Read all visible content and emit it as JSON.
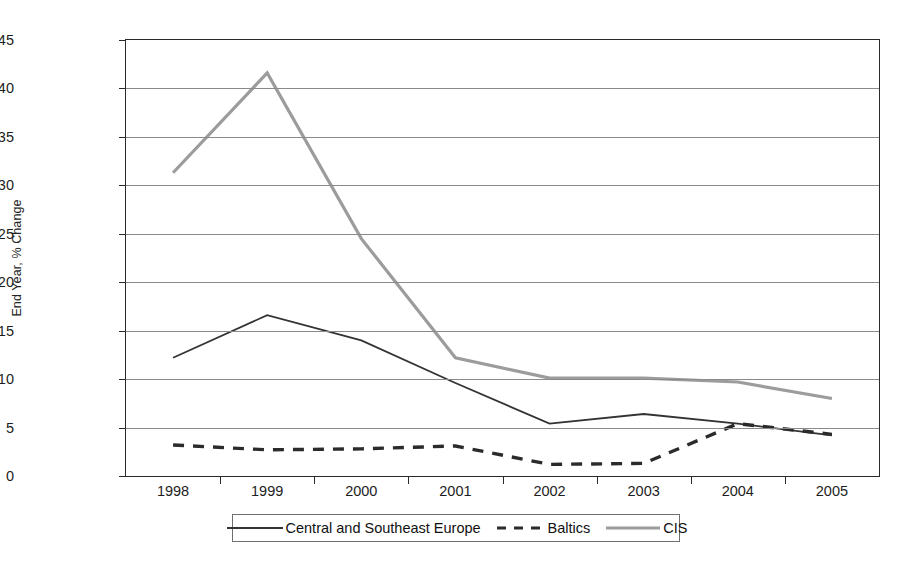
{
  "chart_data": {
    "type": "line",
    "title": "",
    "xlabel": "",
    "ylabel": "End Year, % Change",
    "categories": [
      "1998",
      "1999",
      "2000",
      "2001",
      "2002",
      "2003",
      "2004",
      "2005"
    ],
    "x": [
      1998,
      1999,
      2000,
      2001,
      2002,
      2003,
      2004,
      2005
    ],
    "ylim": [
      0,
      45
    ],
    "yticks": [
      0,
      5,
      10,
      15,
      20,
      25,
      30,
      35,
      40,
      45
    ],
    "ytick_labels": [
      "0",
      "5",
      "10",
      "15",
      "20",
      "25",
      "30",
      "35",
      "40",
      "45"
    ],
    "grid": "horizontal",
    "legend_position": "bottom",
    "series": [
      {
        "name": "Central and Southeast Europe",
        "style": "solid",
        "color": "#333333",
        "values": [
          12.2,
          16.6,
          14.0,
          9.6,
          5.4,
          6.4,
          5.4,
          4.2
        ]
      },
      {
        "name": "Baltics",
        "style": "dashed",
        "color": "#2b2b2b",
        "values": [
          3.2,
          2.7,
          2.8,
          3.1,
          1.2,
          1.3,
          5.4,
          4.3
        ]
      },
      {
        "name": "CIS",
        "style": "solid-light",
        "color": "#9c9c9c",
        "values": [
          31.3,
          41.6,
          24.5,
          12.2,
          10.1,
          10.1,
          9.7,
          8.0
        ]
      }
    ]
  },
  "axes": {
    "y_title": "End Year, % Change"
  },
  "legend": {
    "entries": [
      {
        "label": "Central and Southeast Europe",
        "swatch": "solid-dark-line-swatch"
      },
      {
        "label": "Baltics",
        "swatch": "dashed-dark-line-swatch"
      },
      {
        "label": "CIS",
        "swatch": "solid-grey-line-swatch"
      }
    ]
  }
}
